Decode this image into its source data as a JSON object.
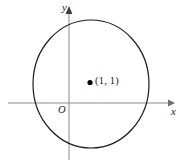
{
  "figure": {
    "title": "",
    "background_color": "#ffffff",
    "width": 182,
    "height": 168
  },
  "axes": {
    "x_axis": {
      "label": "x",
      "icon": "arrow-right-icon",
      "color": "#8c8c8c",
      "y_pixel": 103,
      "x_start_pixel": 8,
      "x_end_pixel": 170
    },
    "y_axis": {
      "label": "y",
      "icon": "arrow-up-icon",
      "color": "#8c8c8c",
      "x_pixel": 69,
      "y_start_pixel": 160,
      "y_end_pixel": 10
    },
    "origin": {
      "label": "O"
    }
  },
  "circle": {
    "stroke_color": "#1a1a1a",
    "fill": "none",
    "center_x_pixel": 91,
    "center_y_pixel": 84,
    "radius_x_pixel": 58,
    "radius_y_pixel": 64
  },
  "points": [
    {
      "name": "center-point",
      "label": "(1, 1)",
      "x": 1,
      "y": 1,
      "marker": "filled-dot",
      "color": "#000000",
      "x_pixel": 90,
      "y_pixel": 82
    }
  ]
}
